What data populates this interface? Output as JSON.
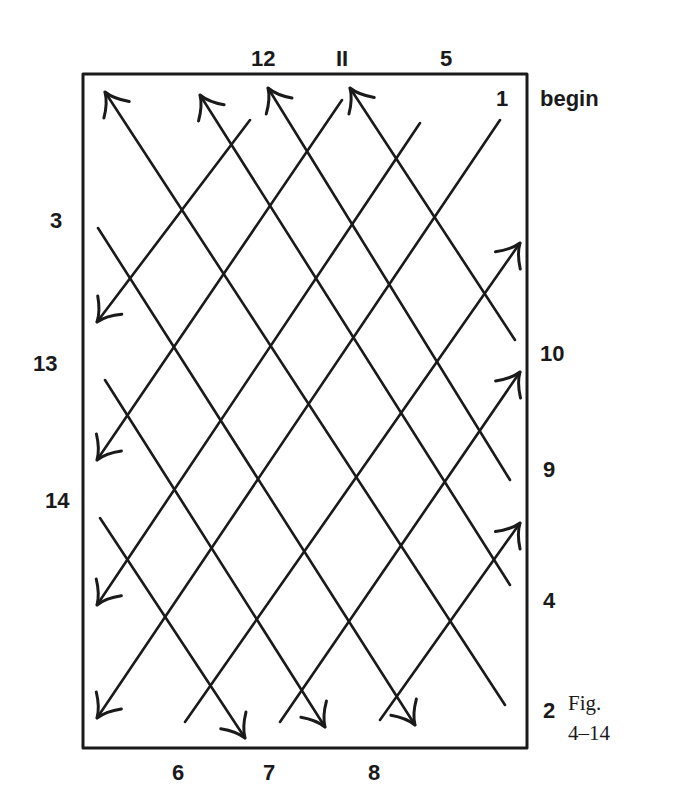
{
  "figure": {
    "caption_line1": "Fig.",
    "caption_line2": "4–14",
    "start_label": "begin",
    "ink_color": "#1a1a1a",
    "background": "#ffffff"
  },
  "labels": {
    "top": [
      {
        "text": "12",
        "x": 251,
        "y": 48
      },
      {
        "text": "II",
        "x": 336,
        "y": 48
      },
      {
        "text": "5",
        "x": 440,
        "y": 48
      }
    ],
    "right": [
      {
        "text": "1",
        "x": 496,
        "y": 88
      },
      {
        "text": "begin",
        "x": 540,
        "y": 88
      },
      {
        "text": "10",
        "x": 540,
        "y": 343
      },
      {
        "text": "9",
        "x": 543,
        "y": 459
      },
      {
        "text": "4",
        "x": 543,
        "y": 590
      },
      {
        "text": "2",
        "x": 543,
        "y": 700
      }
    ],
    "left": [
      {
        "text": "3",
        "x": 50,
        "y": 210
      },
      {
        "text": "13",
        "x": 33,
        "y": 353
      },
      {
        "text": "14",
        "x": 45,
        "y": 490
      }
    ],
    "bottom": [
      {
        "text": "6",
        "x": 172,
        "y": 762
      },
      {
        "text": "7",
        "x": 263,
        "y": 762
      },
      {
        "text": "8",
        "x": 368,
        "y": 762
      }
    ]
  },
  "frame": {
    "x1": 83,
    "y1": 74,
    "x2": 527,
    "y2": 748
  },
  "lines_up_right": [
    {
      "from": [
        500,
        120
      ],
      "to": [
        97,
        718
      ],
      "arrow_end": "lower-left",
      "label": "1"
    },
    {
      "from": [
        420,
        123
      ],
      "to": [
        97,
        605
      ],
      "arrow_end": "lower-left",
      "label": "5"
    },
    {
      "from": [
        342,
        100
      ],
      "to": [
        97,
        460
      ],
      "arrow_end": "lower-left",
      "label": "11"
    },
    {
      "from": [
        250,
        120
      ],
      "to": [
        97,
        322
      ],
      "arrow_end": "lower-left",
      "label": "12"
    },
    {
      "from": [
        185,
        722
      ],
      "to": [
        520,
        243
      ],
      "arrow_end": "upper-right",
      "label": "6"
    },
    {
      "from": [
        280,
        722
      ],
      "to": [
        520,
        372
      ],
      "arrow_end": "upper-right",
      "label": "7"
    },
    {
      "from": [
        380,
        720
      ],
      "to": [
        520,
        523
      ],
      "arrow_end": "upper-right",
      "label": "8"
    }
  ],
  "lines_down_right": [
    {
      "from": [
        105,
        92
      ],
      "to": [
        505,
        705
      ],
      "arrow_end": "upper-left",
      "label": "2"
    },
    {
      "from": [
        200,
        95
      ],
      "to": [
        510,
        585
      ],
      "arrow_end": "upper-left",
      "label": "4"
    },
    {
      "from": [
        268,
        88
      ],
      "to": [
        510,
        480
      ],
      "arrow_end": "upper-left",
      "label": "9"
    },
    {
      "from": [
        350,
        88
      ],
      "to": [
        515,
        340
      ],
      "arrow_end": "upper-left",
      "label": "10"
    },
    {
      "from": [
        98,
        228
      ],
      "to": [
        415,
        725
      ],
      "arrow_end": "lower-right",
      "label": "3"
    },
    {
      "from": [
        105,
        380
      ],
      "to": [
        325,
        727
      ],
      "arrow_end": "lower-right",
      "label": "13"
    },
    {
      "from": [
        100,
        518
      ],
      "to": [
        245,
        738
      ],
      "arrow_end": "lower-right",
      "label": "14"
    }
  ]
}
